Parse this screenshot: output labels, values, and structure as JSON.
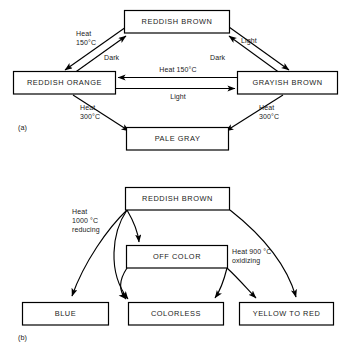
{
  "figure": {
    "panels": [
      {
        "id": "a",
        "caption": "(a)",
        "nodes": [
          {
            "id": "reddish-brown-a",
            "label": "REDDISH BROWN"
          },
          {
            "id": "reddish-orange",
            "label": "REDDISH ORANGE"
          },
          {
            "id": "grayish-brown",
            "label": "GRAYISH BROWN"
          },
          {
            "id": "pale-gray",
            "label": "PALE GRAY"
          }
        ],
        "edge_labels": {
          "heat150_left_line1": "Heat",
          "heat150_left_line2": "150°C",
          "dark_left": "Dark",
          "dark_right": "Dark",
          "light_top_right": "Light",
          "heat150_center": "Heat 150°C",
          "light_center": "Light",
          "heat300_left_line1": "Heat",
          "heat300_left_line2": "300°C",
          "heat300_right_line1": "Heat",
          "heat300_right_line2": "300°C"
        }
      },
      {
        "id": "b",
        "caption": "(b)",
        "nodes": [
          {
            "id": "reddish-brown-b",
            "label": "REDDISH BROWN"
          },
          {
            "id": "off-color",
            "label": "OFF COLOR"
          },
          {
            "id": "blue",
            "label": "BLUE"
          },
          {
            "id": "colorless",
            "label": "COLORLESS"
          },
          {
            "id": "yellow-to-red",
            "label": "YELLOW TO RED"
          }
        ],
        "edge_labels": {
          "reducing_line1": "Heat",
          "reducing_line2": "1000 °C",
          "reducing_line3": "reducing",
          "oxidizing_line1": "Heat 900 °C",
          "oxidizing_line2": "oxidizing"
        }
      }
    ],
    "colors": {
      "stroke": "#000000",
      "fill": "#ffffff",
      "text": "#1a1a1a"
    }
  }
}
